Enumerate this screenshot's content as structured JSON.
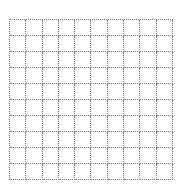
{
  "grid": {
    "rows": 10,
    "cols": 10,
    "cell_width": 16.3,
    "cell_height": 16,
    "line_color": "#777777",
    "line_style": "dotted"
  }
}
